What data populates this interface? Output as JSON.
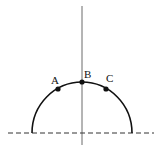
{
  "diagram": {
    "labels": {
      "a": "A",
      "b": "B",
      "c": "C"
    },
    "colors": {
      "stroke": "#111111",
      "axis": "#444444",
      "background": "#ffffff"
    }
  }
}
